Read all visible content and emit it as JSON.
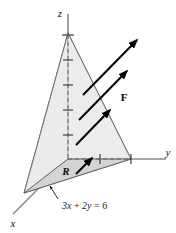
{
  "figure": {
    "background": "#ffffff"
  },
  "axes": {
    "z": {
      "label": "z",
      "direction": "up"
    },
    "y": {
      "label": "y",
      "direction": "right"
    },
    "x": {
      "label": "x",
      "direction": "down-left"
    }
  },
  "labels": {
    "region": "R",
    "field": "F",
    "equation": "3x + 2y = 6",
    "equation_parts": {
      "coef_x": "3",
      "var_x": "x",
      "plus": " + ",
      "coef_y": "2",
      "var_y": "y",
      "equals": " = ",
      "constant": "6"
    }
  },
  "colors": {
    "face_fill": "#eeeeee",
    "base_fill": "#d9d9d9",
    "outline": "#555555",
    "arrow": "#000000",
    "axis": "#777777",
    "dashed": "#666666",
    "text": "#1a1a1a"
  },
  "geometry": {
    "apex": {
      "x": 68,
      "y": 33
    },
    "base_front": {
      "x": 24,
      "y": 193
    },
    "base_right": {
      "x": 131,
      "y": 159
    },
    "base_origin": {
      "x": 68,
      "y": 159
    },
    "tick_count_vertical": 5,
    "tick_count_horizontal": 2
  },
  "vectors": {
    "count": 4,
    "angle_degrees": 45,
    "items": [
      {
        "x1": 83,
        "y1": 95,
        "x2": 139,
        "y2": 38
      },
      {
        "x1": 79,
        "y1": 120,
        "x2": 129,
        "y2": 69
      },
      {
        "x1": 76,
        "y1": 145,
        "x2": 112,
        "y2": 108
      },
      {
        "x1": 76,
        "y1": 174,
        "x2": 94,
        "y2": 156
      }
    ]
  }
}
